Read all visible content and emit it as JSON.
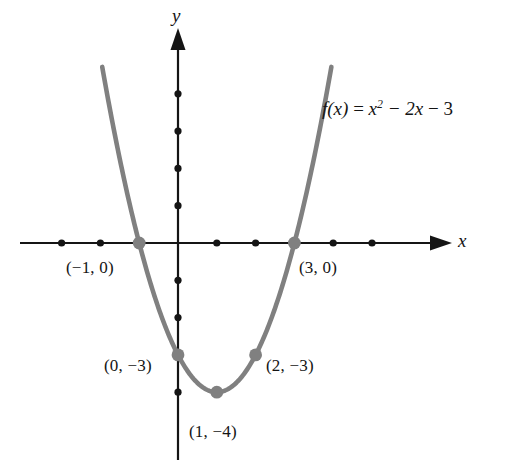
{
  "figure": {
    "kind": "cartesian-graph",
    "axis_x_label": "x",
    "axis_y_label": "y",
    "function_label": {
      "lhs": "f(x)",
      "equals": "=",
      "term1_base": "x",
      "term1_exp": "2",
      "term2": "− 2x",
      "term3": "− 3",
      "plain": "f(x) = x² − 2x − 3"
    },
    "curve_color": "#808080",
    "axis_color": "#151515",
    "point_color": "#808080",
    "tick_color": "#151515"
  },
  "point_labels": {
    "root_left": "(−1, 0)",
    "root_right": "(3, 0)",
    "y_intercept": "(0, −3)",
    "symmetric_point": "(2, −3)",
    "vertex": "(1, −4)"
  },
  "chart_data": {
    "type": "line",
    "title": "",
    "subtitle": "",
    "xlabel": "x",
    "ylabel": "y",
    "equation": "f(x) = x^2 - 2x - 3",
    "grid": false,
    "legend": false,
    "xlim": [
      -4.1,
      6.3
    ],
    "ylim": [
      -6.4,
      5.6
    ],
    "x_ticks": [
      -3,
      -2,
      -1,
      1,
      2,
      3,
      4,
      5
    ],
    "y_ticks": [
      4,
      3,
      2,
      1,
      -1,
      -2,
      -3,
      -4
    ],
    "x": [
      -2.1,
      -1.8,
      -1.5,
      -1.2,
      -1.0,
      -0.7,
      -0.4,
      -0.1,
      0.0,
      0.3,
      0.6,
      1.0,
      1.4,
      1.7,
      2.0,
      2.3,
      2.6,
      3.0,
      3.3,
      3.6,
      3.9,
      4.1
    ],
    "values": [
      5.61,
      3.84,
      2.25,
      0.84,
      0.0,
      -1.11,
      -2.04,
      -2.79,
      -3.0,
      -3.51,
      -3.84,
      -4.0,
      -3.84,
      -3.51,
      -3.0,
      -2.31,
      -1.44,
      0.0,
      1.29,
      2.76,
      4.41,
      5.61
    ],
    "series": [
      {
        "name": "f(x) = x^2 - 2x - 3",
        "values": [
          5.61,
          3.84,
          2.25,
          0.84,
          0.0,
          -1.11,
          -2.04,
          -2.79,
          -3.0,
          -3.51,
          -3.84,
          -4.0,
          -3.84,
          -3.51,
          -3.0,
          -2.31,
          -1.44,
          0.0,
          1.29,
          2.76,
          4.41,
          5.61
        ]
      }
    ],
    "annotated_points": [
      {
        "label": "(−1, 0)",
        "x": -1,
        "y": 0
      },
      {
        "label": "(3, 0)",
        "x": 3,
        "y": 0
      },
      {
        "label": "(0, −3)",
        "x": 0,
        "y": -3
      },
      {
        "label": "(2, −3)",
        "x": 2,
        "y": -3
      },
      {
        "label": "(1, −4)",
        "x": 1,
        "y": -4
      }
    ],
    "annotations": [
      "f(x) = x² − 2x − 3"
    ]
  }
}
